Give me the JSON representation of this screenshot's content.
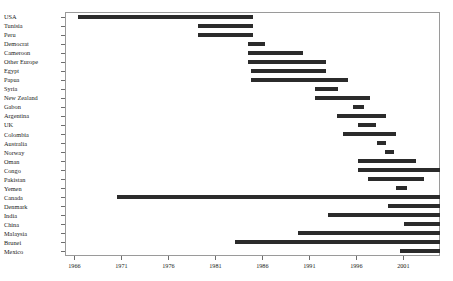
{
  "chart_data": {
    "type": "bar",
    "orientation": "horizontal-range",
    "subtype": "gantt",
    "title": "",
    "xlabel": "",
    "ylabel": "",
    "xlim": [
      1965.0,
      2004.9
    ],
    "grid": false,
    "legend": null,
    "axis_color": "#6d6d6d",
    "bar_color": "#2b2b2b",
    "xticks": [
      1966,
      1971,
      1976,
      1981,
      1986,
      1991,
      1996,
      2001
    ],
    "xtick_labels": [
      "1966",
      "1971",
      "1976",
      "1981",
      "1986",
      "1991",
      "1996",
      "2001"
    ],
    "categories": [
      "USA",
      "Tunisia",
      "Peru",
      "Democrat",
      "Cameroon",
      "Other Europe",
      "Egypt",
      "Papua",
      "Syria",
      "New Zealand",
      "Gabon",
      "Argentina",
      "UK",
      "Colombia",
      "Australia",
      "Norway",
      "Oman",
      "Congo",
      "Pakistan",
      "Yemen",
      "Canada",
      "Denmark",
      "India",
      "China",
      "Malaysia",
      "Brunei",
      "Mexico"
    ],
    "bars": [
      {
        "category": "USA",
        "start": 1966.4,
        "end": 1985.0
      },
      {
        "category": "Tunisia",
        "start": 1979.2,
        "end": 1985.0
      },
      {
        "category": "Peru",
        "start": 1979.2,
        "end": 1985.0
      },
      {
        "category": "Democrat",
        "start": 1984.5,
        "end": 1986.3
      },
      {
        "category": "Cameroon",
        "start": 1984.5,
        "end": 1990.3
      },
      {
        "category": "Other Europe",
        "start": 1984.5,
        "end": 1992.8
      },
      {
        "category": "Egypt",
        "start": 1984.8,
        "end": 1992.8
      },
      {
        "category": "Papua",
        "start": 1984.8,
        "end": 1995.1
      },
      {
        "category": "Syria",
        "start": 1991.6,
        "end": 1994.0
      },
      {
        "category": "New Zealand",
        "start": 1991.6,
        "end": 1997.4
      },
      {
        "category": "Gabon",
        "start": 1995.6,
        "end": 1996.8
      },
      {
        "category": "Argentina",
        "start": 1993.9,
        "end": 1999.2
      },
      {
        "category": "UK",
        "start": 1996.2,
        "end": 1998.1
      },
      {
        "category": "Colombia",
        "start": 1994.6,
        "end": 2000.2
      },
      {
        "category": "Australia",
        "start": 1998.2,
        "end": 1999.2
      },
      {
        "category": "Norway",
        "start": 1999.0,
        "end": 2000.0
      },
      {
        "category": "Oman",
        "start": 1996.2,
        "end": 2002.3
      },
      {
        "category": "Congo",
        "start": 1996.2,
        "end": 2004.9
      },
      {
        "category": "Pakistan",
        "start": 1997.2,
        "end": 2003.2
      },
      {
        "category": "Yemen",
        "start": 2000.2,
        "end": 2001.4
      },
      {
        "category": "Canada",
        "start": 1970.5,
        "end": 2004.9
      },
      {
        "category": "Denmark",
        "start": 1999.4,
        "end": 2004.9
      },
      {
        "category": "India",
        "start": 1993.0,
        "end": 2004.9
      },
      {
        "category": "China",
        "start": 2001.1,
        "end": 2004.9
      },
      {
        "category": "Malaysia",
        "start": 1989.8,
        "end": 2004.9
      },
      {
        "category": "Brunei",
        "start": 1983.1,
        "end": 2004.9
      },
      {
        "category": "Mexico",
        "start": 2000.6,
        "end": 2004.9
      }
    ]
  }
}
